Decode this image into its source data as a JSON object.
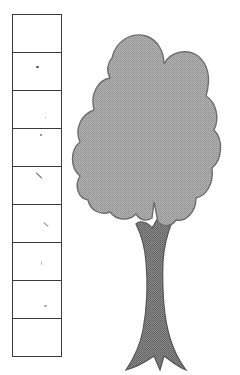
{
  "scale": {
    "box_count": 9,
    "boxes": [
      {
        "index": 1,
        "label": ""
      },
      {
        "index": 2,
        "label": ""
      },
      {
        "index": 3,
        "label": ""
      },
      {
        "index": 4,
        "label": ""
      },
      {
        "index": 5,
        "label": ""
      },
      {
        "index": 6,
        "label": ""
      },
      {
        "index": 7,
        "label": ""
      },
      {
        "index": 8,
        "label": ""
      },
      {
        "index": 9,
        "label": ""
      }
    ],
    "border_color": "#3a3a3a"
  },
  "tree": {
    "crown_color": "#a9a9a9",
    "crown_outline": "#6e6e6e",
    "trunk_color": "#7a7a7a",
    "trunk_outline": "#555555"
  }
}
